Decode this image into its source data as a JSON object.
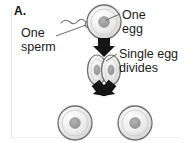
{
  "figure": {
    "panel_label": "A.",
    "title_implied": "Identical twin formation",
    "background_color": "#ffffff",
    "width": 192,
    "height": 143
  },
  "captions": {
    "sperm": "One\nsperm",
    "egg": "One\negg",
    "divides": "Single egg\ndivides"
  },
  "colors": {
    "cell_membrane": "#6e6e6e",
    "cell_fill_light": "#f4f4f4",
    "cell_fill_mid": "#dcdcdc",
    "nucleus": "#9a9a9a",
    "arrow": "#1a1a1a",
    "leader_line": "#5a5a5a",
    "text": "#1a1a1a",
    "frame": "#e4e4e4"
  },
  "stages": [
    {
      "name": "fertilization",
      "label": "One egg fertilized by one sperm",
      "cell_count": 1
    },
    {
      "name": "division",
      "label": "Single egg divides",
      "cell_count": 2
    },
    {
      "name": "twins",
      "label": "Two identical cells",
      "cell_count": 2
    }
  ],
  "icons": {
    "sperm": "sperm-icon",
    "egg": "egg-cell-icon",
    "dividing": "dividing-cell-icon",
    "arrow_down": "down-arrow-icon",
    "arrow_down_left": "down-left-arrow-icon",
    "arrow_down_right": "down-right-arrow-icon"
  }
}
